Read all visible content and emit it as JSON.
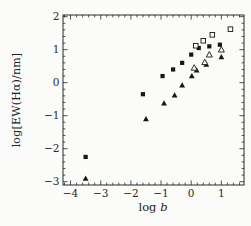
{
  "figure": {
    "background": "#fbfbf9",
    "ink_color": "#2a2a2a",
    "marker_color": "#161616"
  },
  "chart_data": {
    "type": "scatter",
    "title": "",
    "xlabel": "log b",
    "xlabel_prefix": "log",
    "xlabel_italic": "b",
    "ylabel": "log[EW(Hα)/nm]",
    "xlim": [
      -4.25,
      1.75
    ],
    "ylim": [
      -3.1,
      2.05
    ],
    "x_major_ticks": [
      -4,
      -3,
      -2,
      -1,
      0,
      1
    ],
    "y_major_ticks": [
      -3,
      -2,
      -1,
      0,
      1,
      2
    ],
    "x_minor_step": 0.2,
    "y_minor_step": 0.2,
    "grid": false,
    "legend": "none",
    "series": [
      {
        "name": "filled-squares",
        "marker": "square-filled",
        "points": [
          [
            -3.5,
            -2.25
          ],
          [
            -1.6,
            -0.35
          ],
          [
            -0.95,
            0.2
          ],
          [
            -0.6,
            0.4
          ],
          [
            -0.3,
            0.6
          ],
          [
            0.0,
            0.85
          ],
          [
            0.25,
            1.05
          ],
          [
            0.6,
            1.1
          ],
          [
            0.95,
            1.15
          ]
        ]
      },
      {
        "name": "filled-triangles",
        "marker": "triangle-filled",
        "points": [
          [
            -3.5,
            -2.9
          ],
          [
            -1.5,
            -1.1
          ],
          [
            -0.9,
            -0.62
          ],
          [
            -0.55,
            -0.38
          ],
          [
            -0.3,
            -0.08
          ],
          [
            0.02,
            0.2
          ],
          [
            0.18,
            0.38
          ],
          [
            0.5,
            0.55
          ],
          [
            1.0,
            0.78
          ]
        ]
      },
      {
        "name": "open-squares",
        "marker": "square-open",
        "points": [
          [
            0.15,
            1.12
          ],
          [
            0.4,
            1.27
          ],
          [
            0.7,
            1.45
          ],
          [
            1.3,
            1.62
          ]
        ]
      },
      {
        "name": "open-triangles",
        "marker": "triangle-open",
        "points": [
          [
            0.1,
            0.45
          ],
          [
            0.45,
            0.62
          ],
          [
            0.6,
            0.85
          ],
          [
            1.0,
            1.0
          ]
        ]
      }
    ]
  }
}
